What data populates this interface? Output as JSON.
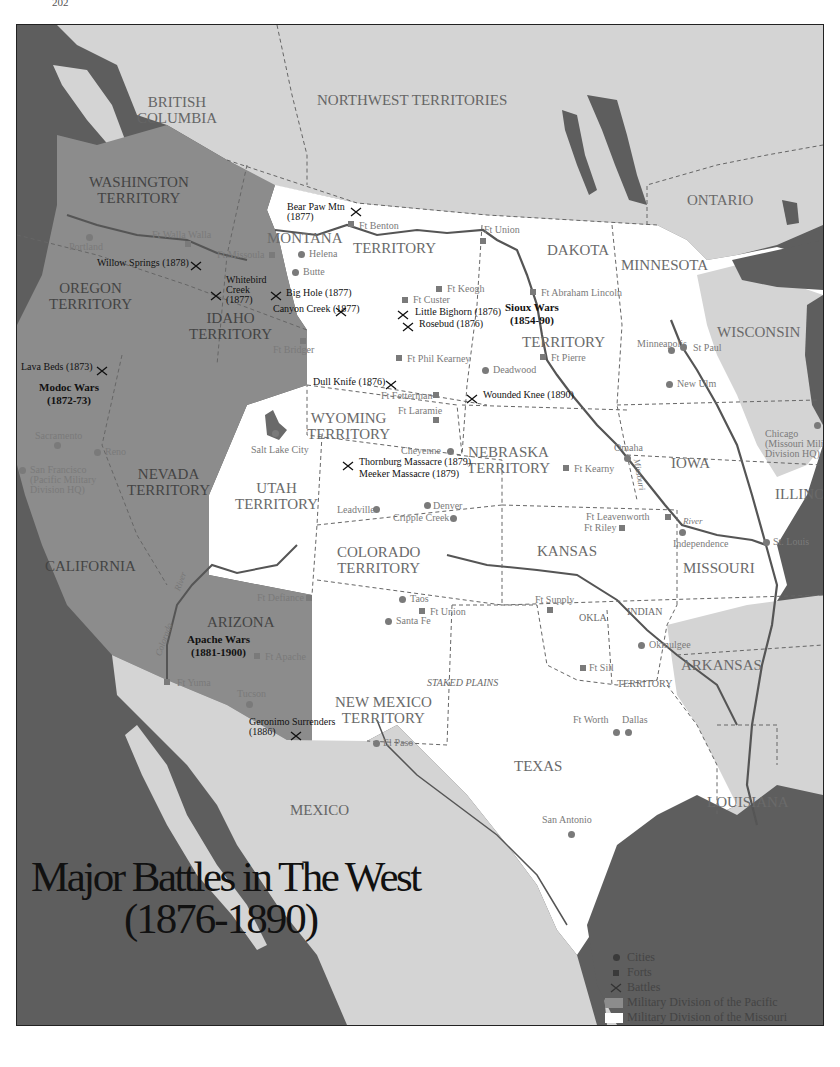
{
  "page_number": "202",
  "title": {
    "line1": "Major Battles in The West",
    "line2": "(1876-1890)"
  },
  "colors": {
    "water": "#5e5e5e",
    "foreign_land": "#d4d4d4",
    "pacific_division": "#8c8c8c",
    "missouri_division": "#ffffff",
    "rivers": "#555555",
    "borders": "#666666"
  },
  "regions": [
    {
      "id": "british-columbia",
      "label": "BRITISH\nCOLUMBIA",
      "x": 120,
      "y": 70
    },
    {
      "id": "northwest-territories",
      "label": "NORTHWEST TERRITORIES",
      "x": 300,
      "y": 68
    },
    {
      "id": "ontario",
      "label": "ONTARIO",
      "x": 670,
      "y": 168
    },
    {
      "id": "washington",
      "label": "WASHINGTON\nTERRITORY",
      "x": 72,
      "y": 150
    },
    {
      "id": "oregon",
      "label": "OREGON\nTERRITORY",
      "x": 32,
      "y": 256
    },
    {
      "id": "idaho",
      "label": "IDAHO\nTERRITORY",
      "x": 172,
      "y": 286
    },
    {
      "id": "montana",
      "label": "MONTANA",
      "x": 250,
      "y": 206
    },
    {
      "id": "montana-territory",
      "label": "TERRITORY",
      "x": 336,
      "y": 216
    },
    {
      "id": "dakota",
      "label": "DAKOTA",
      "x": 530,
      "y": 218
    },
    {
      "id": "dakota-territory",
      "label": "TERRITORY",
      "x": 505,
      "y": 310
    },
    {
      "id": "minnesota",
      "label": "MINNESOTA",
      "x": 604,
      "y": 233
    },
    {
      "id": "wisconsin",
      "label": "WISCONSIN",
      "x": 700,
      "y": 300
    },
    {
      "id": "wyoming",
      "label": "WYOMING\nTERRITORY",
      "x": 290,
      "y": 386
    },
    {
      "id": "nebraska",
      "label": "NEBRASKA\nTERRITORY",
      "x": 450,
      "y": 420
    },
    {
      "id": "iowa",
      "label": "IOWA",
      "x": 654,
      "y": 431
    },
    {
      "id": "illinois",
      "label": "ILLINOIS",
      "x": 758,
      "y": 462
    },
    {
      "id": "nevada",
      "label": "NEVADA\nTERRITORY",
      "x": 110,
      "y": 442
    },
    {
      "id": "utah",
      "label": "UTAH\nTERRITORY",
      "x": 218,
      "y": 456
    },
    {
      "id": "california",
      "label": "CALIFORNIA",
      "x": 28,
      "y": 534
    },
    {
      "id": "colorado",
      "label": "COLORADO\nTERRITORY",
      "x": 320,
      "y": 520
    },
    {
      "id": "kansas",
      "label": "KANSAS",
      "x": 520,
      "y": 519
    },
    {
      "id": "missouri",
      "label": "MISSOURI",
      "x": 666,
      "y": 536
    },
    {
      "id": "arizona",
      "label": "ARIZONA",
      "x": 190,
      "y": 590
    },
    {
      "id": "new-mexico",
      "label": "NEW MEXICO\nTERRITORY",
      "x": 318,
      "y": 670
    },
    {
      "id": "staked-plains",
      "label": "STAKED PLAINS",
      "x": 410,
      "y": 653
    },
    {
      "id": "okla",
      "label": "OKLA",
      "x": 562,
      "y": 588
    },
    {
      "id": "indian",
      "label": "INDIAN",
      "x": 610,
      "y": 582
    },
    {
      "id": "indian-territory",
      "label": "TERRITORY",
      "x": 600,
      "y": 654
    },
    {
      "id": "arkansas",
      "label": "ARKANSAS",
      "x": 664,
      "y": 633
    },
    {
      "id": "texas",
      "label": "TEXAS",
      "x": 497,
      "y": 734
    },
    {
      "id": "louisiana",
      "label": "LOUISIANA",
      "x": 690,
      "y": 770
    },
    {
      "id": "mexico",
      "label": "MEXICO",
      "x": 273,
      "y": 778
    }
  ],
  "cities": [
    {
      "name": "Portland",
      "x": 70,
      "y": 210,
      "dot_x": 72,
      "dot_y": 212,
      "label_x": 52,
      "label_y": 217
    },
    {
      "name": "Helena",
      "dot_x": 284,
      "dot_y": 229,
      "label_x": 292,
      "label_y": 224
    },
    {
      "name": "Butte",
      "dot_x": 278,
      "dot_y": 247,
      "label_x": 286,
      "label_y": 242
    },
    {
      "name": "Deadwood",
      "dot_x": 468,
      "dot_y": 345,
      "label_x": 476,
      "label_y": 340
    },
    {
      "name": "Minneapolis",
      "dot_x": 654,
      "dot_y": 325,
      "label_x": 620,
      "label_y": 314
    },
    {
      "name": "St Paul",
      "dot_x": 666,
      "dot_y": 322,
      "label_x": 676,
      "label_y": 318
    },
    {
      "name": "New Ulm",
      "dot_x": 652,
      "dot_y": 359,
      "label_x": 660,
      "label_y": 354
    },
    {
      "name": "Sacramento",
      "dot_x": 40,
      "dot_y": 420,
      "label_x": 18,
      "label_y": 406
    },
    {
      "name": "Reno",
      "dot_x": 80,
      "dot_y": 427,
      "label_x": 88,
      "label_y": 422
    },
    {
      "name": "San Francisco\n(Pacific Military\nDivision HQ)",
      "dot_x": 5,
      "dot_y": 445,
      "label_x": 13,
      "label_y": 440
    },
    {
      "name": "Salt Lake City",
      "dot_x": 258,
      "dot_y": 408,
      "label_x": 234,
      "label_y": 420
    },
    {
      "name": "Cheyenne",
      "dot_x": 433,
      "dot_y": 426,
      "label_x": 384,
      "label_y": 421
    },
    {
      "name": "Omaha",
      "dot_x": 610,
      "dot_y": 433,
      "label_x": 597,
      "label_y": 418
    },
    {
      "name": "Chicago\n(Missouri Military\nDivision HQ)",
      "dot_x": 800,
      "dot_y": 400,
      "label_x": 748,
      "label_y": 404
    },
    {
      "name": "Leadville",
      "dot_x": 359,
      "dot_y": 484,
      "label_x": 320,
      "label_y": 480
    },
    {
      "name": "Denver",
      "dot_x": 410,
      "dot_y": 480,
      "label_x": 416,
      "label_y": 476
    },
    {
      "name": "Cripple Creek",
      "dot_x": 436,
      "dot_y": 493,
      "label_x": 376,
      "label_y": 488
    },
    {
      "name": "Independence",
      "dot_x": 665,
      "dot_y": 507,
      "label_x": 656,
      "label_y": 514
    },
    {
      "name": "St. Louis",
      "dot_x": 749,
      "dot_y": 517,
      "label_x": 756,
      "label_y": 512
    },
    {
      "name": "Taos",
      "dot_x": 385,
      "dot_y": 574,
      "label_x": 393,
      "label_y": 569
    },
    {
      "name": "Santa Fe",
      "dot_x": 371,
      "dot_y": 596,
      "label_x": 379,
      "label_y": 591
    },
    {
      "name": "Okmulgee",
      "dot_x": 624,
      "dot_y": 620,
      "label_x": 632,
      "label_y": 615
    },
    {
      "name": "Tucson",
      "dot_x": 232,
      "dot_y": 679,
      "label_x": 220,
      "label_y": 664
    },
    {
      "name": "El Paso",
      "dot_x": 359,
      "dot_y": 718,
      "label_x": 366,
      "label_y": 713
    },
    {
      "name": "Ft Worth",
      "dot_x": 599,
      "dot_y": 707,
      "label_x": 556,
      "label_y": 690
    },
    {
      "name": "Dallas",
      "dot_x": 611,
      "dot_y": 707,
      "label_x": 605,
      "label_y": 690
    },
    {
      "name": "San Antonio",
      "dot_x": 554,
      "dot_y": 809,
      "label_x": 525,
      "label_y": 790
    }
  ],
  "forts": [
    {
      "name": "Ft Walla Walla",
      "sq_x": 171,
      "sq_y": 219,
      "label_x": 135,
      "label_y": 205
    },
    {
      "name": "Ft Benton",
      "sq_x": 334,
      "sq_y": 199,
      "label_x": 342,
      "label_y": 196
    },
    {
      "name": "Ft Missoula",
      "sq_x": 255,
      "sq_y": 230,
      "label_x": 200,
      "label_y": 225
    },
    {
      "name": "Ft Union",
      "sq_x": 466,
      "sq_y": 216,
      "label_x": 467,
      "label_y": 200
    },
    {
      "name": "Ft Keogh",
      "sq_x": 422,
      "sq_y": 264,
      "label_x": 430,
      "label_y": 259
    },
    {
      "name": "Ft Custer",
      "sq_x": 388,
      "sq_y": 275,
      "label_x": 396,
      "label_y": 270
    },
    {
      "name": "Ft Abraham Lincoln",
      "sq_x": 516,
      "sq_y": 267,
      "label_x": 524,
      "label_y": 263
    },
    {
      "name": "Ft Bridger",
      "sq_x": 286,
      "sq_y": 316,
      "label_x": 256,
      "label_y": 320
    },
    {
      "name": "Ft Phil Kearney",
      "sq_x": 382,
      "sq_y": 333,
      "label_x": 390,
      "label_y": 329
    },
    {
      "name": "Ft Pierre",
      "sq_x": 526,
      "sq_y": 332,
      "label_x": 534,
      "label_y": 328
    },
    {
      "name": "Ft Fetterman",
      "sq_x": 419,
      "sq_y": 370,
      "label_x": 364,
      "label_y": 366
    },
    {
      "name": "Ft Laramie",
      "sq_x": 419,
      "sq_y": 395,
      "label_x": 381,
      "label_y": 381
    },
    {
      "name": "Ft Kearny",
      "sq_x": 549,
      "sq_y": 443,
      "label_x": 557,
      "label_y": 439
    },
    {
      "name": "Ft Leavenworth",
      "sq_x": 651,
      "sq_y": 492,
      "label_x": 569,
      "label_y": 487
    },
    {
      "name": "Ft Riley",
      "sq_x": 605,
      "sq_y": 503,
      "label_x": 567,
      "label_y": 498
    },
    {
      "name": "Ft Defiance",
      "sq_x": 292,
      "sq_y": 573,
      "label_x": 240,
      "label_y": 568
    },
    {
      "name": "Ft Union",
      "sq_x": 405,
      "sq_y": 586,
      "label_x": 413,
      "label_y": 582
    },
    {
      "name": "Ft Supply",
      "sq_x": 533,
      "sq_y": 585,
      "label_x": 518,
      "label_y": 570
    },
    {
      "name": "Ft Apache",
      "sq_x": 240,
      "sq_y": 631,
      "label_x": 248,
      "label_y": 627
    },
    {
      "name": "Ft Sill",
      "sq_x": 566,
      "sq_y": 643,
      "label_x": 572,
      "label_y": 638
    },
    {
      "name": "Ft Yuma",
      "sq_x": 150,
      "sq_y": 657,
      "label_x": 160,
      "label_y": 653
    }
  ],
  "battles": [
    {
      "name": "Bear Paw Mtn\n(1877)",
      "x_x": 339,
      "x_y": 183,
      "label_x": 270,
      "label_y": 177
    },
    {
      "name": "Willow Springs (1878)",
      "x_x": 179,
      "x_y": 237,
      "label_x": 80,
      "label_y": 233
    },
    {
      "name": "Whitebird\nCreek\n(1877)",
      "x_x": 199,
      "x_y": 267,
      "label_x": 209,
      "label_y": 250
    },
    {
      "name": "Big Hole (1877)",
      "x_x": 259,
      "x_y": 267,
      "label_x": 269,
      "label_y": 263
    },
    {
      "name": "Canyon Creek (1877)",
      "x_x": 324,
      "x_y": 283,
      "label_x": 256,
      "label_y": 279
    },
    {
      "name": "Little Bighorn (1876)",
      "x_x": 386,
      "x_y": 286,
      "label_x": 398,
      "label_y": 282
    },
    {
      "name": "Rosebud (1876)",
      "x_x": 391,
      "x_y": 298,
      "label_x": 402,
      "label_y": 294
    },
    {
      "name": "Lava Beds (1873)",
      "x_x": 85,
      "x_y": 342,
      "label_x": 4,
      "label_y": 337
    },
    {
      "name": "Dull Knife (1876)",
      "x_x": 374,
      "x_y": 356,
      "label_x": 296,
      "label_y": 352
    },
    {
      "name": "Wounded Knee (1890)",
      "x_x": 455,
      "x_y": 370,
      "label_x": 466,
      "label_y": 365
    },
    {
      "name": "Thornburg Massacre (1879)",
      "x_x": 331,
      "x_y": 437,
      "label_x": 342,
      "label_y": 432
    },
    {
      "name": "Meeker Massacre (1879)",
      "x_x": null,
      "x_y": null,
      "label_x": 342,
      "label_y": 444
    },
    {
      "name": "Geronimo Surrenders\n(1886)",
      "x_x": 279,
      "x_y": 707,
      "label_x": 232,
      "label_y": 692
    }
  ],
  "wars": [
    {
      "name": "Modoc Wars\n(1872-73)",
      "x": 22,
      "y": 356
    },
    {
      "name": "Sioux Wars\n(1854-90)",
      "x": 488,
      "y": 276
    },
    {
      "name": "Apache Wars\n(1881-1900)",
      "x": 170,
      "y": 608
    }
  ],
  "rivers": [
    {
      "name": "Missouri",
      "x": 606,
      "y": 445,
      "rotate": 80
    },
    {
      "name": "River",
      "x": 666,
      "y": 492,
      "rotate": 0
    },
    {
      "name": "River",
      "x": 154,
      "y": 552,
      "rotate": -70
    },
    {
      "name": "Colorado",
      "x": 130,
      "y": 610,
      "rotate": -70
    }
  ],
  "legend": {
    "items": [
      {
        "symbol": "dot",
        "label": "Cities"
      },
      {
        "symbol": "square",
        "label": "Forts"
      },
      {
        "symbol": "cross",
        "label": "Battles"
      },
      {
        "symbol": "swatch-pacific",
        "label": "Military Division of the Pacific"
      },
      {
        "symbol": "swatch-missouri",
        "label": "Military Division of the Missouri"
      }
    ]
  }
}
